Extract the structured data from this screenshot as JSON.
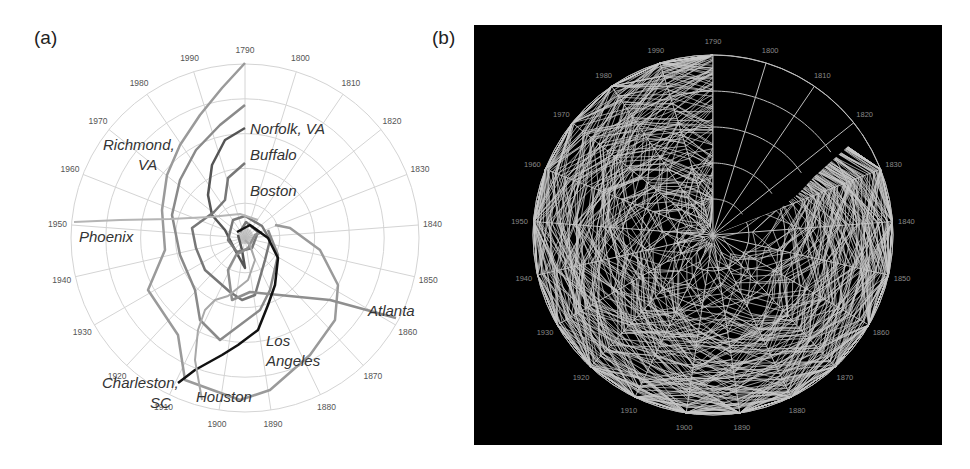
{
  "panels": {
    "a": {
      "label": "(a)"
    },
    "b": {
      "label": "(b)"
    }
  },
  "chart_data": [
    {
      "type": "line",
      "subtype": "radial spiral (polar) line chart",
      "panel": "(a)",
      "title": "",
      "angular_axis": {
        "label": "Census year",
        "ticks": [
          "1790",
          "1800",
          "1810",
          "1820",
          "1830",
          "1840",
          "1850",
          "1860",
          "1870",
          "1880",
          "1890",
          "1900",
          "1910",
          "1920",
          "1930",
          "1940",
          "1950",
          "1960",
          "1970",
          "1980",
          "1990"
        ],
        "start": "1790 at top, clockwise"
      },
      "radial_axis": {
        "label": "relative rank / value (center = 0, edge = 1)",
        "rings": 5,
        "range": [
          0,
          1
        ]
      },
      "grid": true,
      "legend": "inline labels",
      "series": [
        {
          "name": "Norfolk, VA",
          "color": "#8a8a8a",
          "width": 2.5,
          "label_pos": [
            250,
            130
          ],
          "values": [
            0.64,
            0.6,
            0.57,
            0.55,
            0.52,
            0.5,
            0.47,
            0.45,
            0.42,
            0.4,
            0.38,
            0.36,
            0.35,
            0.36,
            0.4,
            0.45,
            0.5,
            0.55,
            0.6,
            0.68,
            0.78
          ]
        },
        {
          "name": "Buffalo",
          "color": "#555555",
          "width": 2.5,
          "label_pos": [
            250,
            160
          ],
          "values": [
            0.52,
            0.48,
            0.44,
            0.4,
            0.36,
            0.33,
            0.3,
            0.27,
            0.24,
            0.2,
            0.16,
            0.12,
            0.1,
            0.1,
            0.11,
            0.13,
            0.2,
            0.28,
            0.36,
            0.44,
            0.5
          ]
        },
        {
          "name": "Boston",
          "color": "#777777",
          "width": 2.5,
          "label_pos": [
            250,
            196
          ],
          "values": [
            0.12,
            0.1,
            0.09,
            0.08,
            0.07,
            0.06,
            0.05,
            0.05,
            0.05,
            0.05,
            0.05,
            0.05,
            0.06,
            0.06,
            0.07,
            0.08,
            0.09,
            0.1,
            0.11,
            0.12,
            0.13
          ]
        },
        {
          "name": "Richmond, VA",
          "color": "#9a9a9a",
          "width": 2.5,
          "label_pos": [
            105,
            150
          ],
          "values": [
            0.98,
            0.92,
            0.86,
            0.82,
            0.78,
            0.74,
            0.7,
            0.66,
            0.62,
            0.58,
            0.56,
            0.56,
            0.62,
            0.65,
            0.68,
            0.7,
            0.72,
            0.75,
            0.8,
            0.88,
            0.96
          ]
        },
        {
          "name": "Phoenix",
          "color": "#b5b5b5",
          "width": 2,
          "label_pos": [
            80,
            242
          ],
          "values": [
            null,
            null,
            null,
            null,
            null,
            null,
            null,
            null,
            null,
            null,
            null,
            null,
            0.95,
            0.85,
            0.7,
            0.58,
            0.98,
            0.4,
            0.25,
            0.15,
            0.1
          ]
        },
        {
          "name": "Atlanta",
          "color": "#8f8f8f",
          "width": 2.5,
          "label_pos": [
            368,
            313
          ],
          "values": [
            null,
            null,
            null,
            null,
            null,
            null,
            null,
            0.98,
            0.9,
            0.8,
            0.7,
            0.6,
            0.5,
            0.4,
            0.35,
            0.3,
            0.28,
            0.25,
            0.25,
            0.28,
            0.3
          ]
        },
        {
          "name": "Los Angeles",
          "color": "#111111",
          "width": 2.5,
          "label_pos": [
            265,
            345
          ],
          "values": [
            null,
            null,
            null,
            null,
            null,
            null,
            null,
            null,
            null,
            0.6,
            0.46,
            0.3,
            0.18,
            0.1,
            0.05,
            0.03,
            0.03,
            0.02,
            0.02,
            0.02,
            0.02
          ]
        },
        {
          "name": "Charleston, SC",
          "color": "#111111",
          "width": 2.5,
          "label_pos": [
            100,
            385
          ],
          "values": []
        },
        {
          "name": "Houston",
          "color": "#a8a8a8",
          "width": 2,
          "label_pos": [
            196,
            400
          ],
          "values": [
            null,
            null,
            null,
            null,
            null,
            null,
            null,
            null,
            0.9,
            0.85,
            0.8,
            0.72,
            0.62,
            0.52,
            0.42,
            0.34,
            0.25,
            0.18,
            0.12,
            0.1,
            0.08
          ]
        }
      ]
    },
    {
      "type": "line",
      "subtype": "radial spiral (polar) line chart, many series",
      "panel": "(b)",
      "title": "",
      "background": "#000000",
      "line_color": "#c8c8c8",
      "angular_axis": {
        "ticks": [
          "1790",
          "1800",
          "1810",
          "1820",
          "1830",
          "1840",
          "1850",
          "1860",
          "1870",
          "1880",
          "1890",
          "1900",
          "1910",
          "1920",
          "1930",
          "1940",
          "1950",
          "1960",
          "1970",
          "1980",
          "1990"
        ],
        "start": "1790 at top, clockwise"
      },
      "radial_axis": {
        "rings": 5,
        "range": [
          0,
          1
        ]
      },
      "grid": true,
      "note": "Dense overplotted series (hundreds of cities); empty wedge from 1790 to ~1830 inner region"
    }
  ]
}
